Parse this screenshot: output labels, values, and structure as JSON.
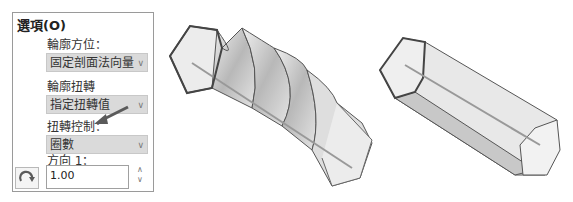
{
  "panel": {
    "title": "選項(O)",
    "profile_orientation_label": "輪廓方位：",
    "profile_orientation_value": "固定剖面法向量",
    "profile_twist_label": "輪廓扭轉",
    "profile_twist_value": "指定扭轉值",
    "twist_control_label": "扭轉控制：",
    "twist_control_value": "圈數",
    "direction_label": "方向 1：",
    "direction_value": "1.00",
    "icons": {
      "dropdown": "chevron-down-icon",
      "reverse": "reverse-direction-icon",
      "spin_up": "chevron-up-icon",
      "spin_down": "chevron-down-icon"
    }
  },
  "annotation": {
    "arrow_color": "#5a5a5a"
  },
  "figures": {
    "left": "twisted-hexagon-sweep",
    "right": "straight-hexagon-prism"
  }
}
